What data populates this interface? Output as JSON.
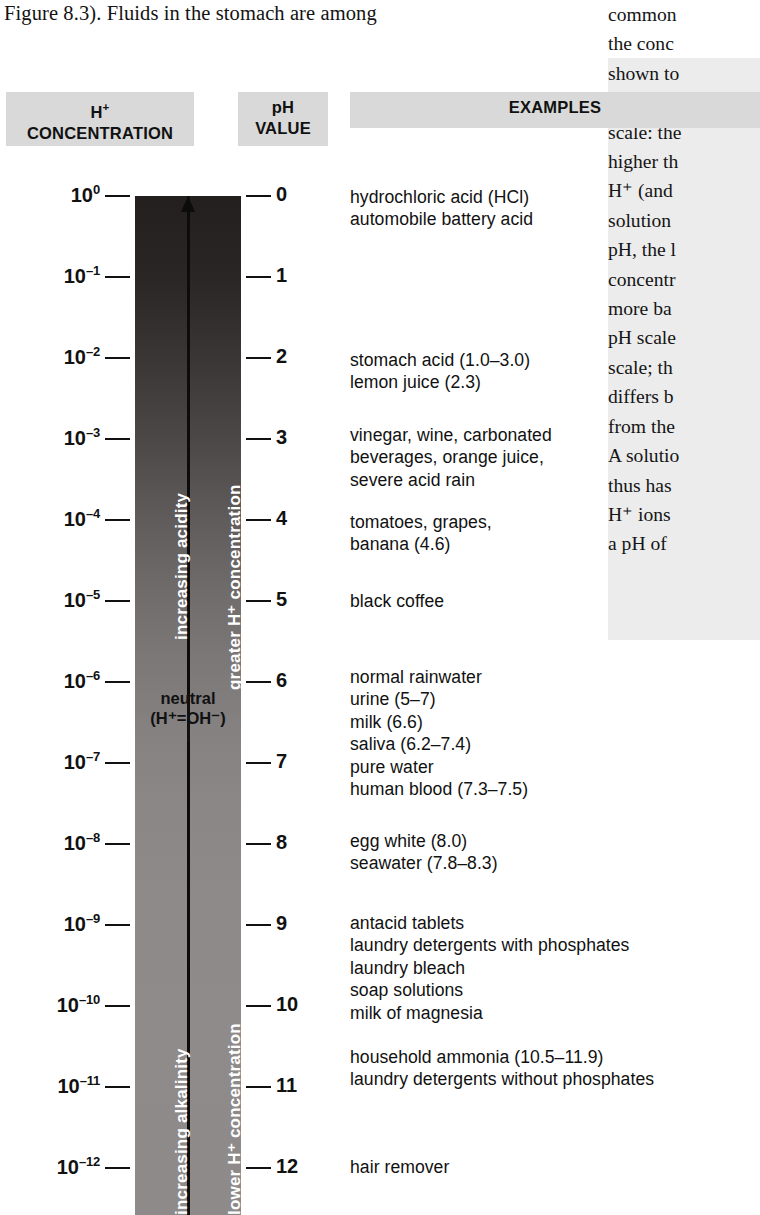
{
  "running_text": "Figure 8.3). Fluids in the stomach are among",
  "right_column_lines": [
    "common",
    "the conc",
    "shown to",
    "The pH s",
    "scale: the",
    "higher th",
    "H⁺ (and",
    "solution",
    "pH, the l",
    "concentr",
    "more ba",
    "pH scale",
    "scale; th",
    "differs b",
    "from the",
    "A solutio",
    "thus has",
    "H⁺ ions",
    "a pH of "
  ],
  "headers": {
    "concentration_line1": "H",
    "concentration_sup": "+",
    "concentration_line2": "CONCENTRATION",
    "ph_line1": "pH",
    "ph_line2": "VALUE",
    "examples": "EXAMPLES"
  },
  "bar_labels": {
    "acid_left": "increasing acidity",
    "acid_right": "greater H⁺ concentration",
    "base_left": "increasing alkalinity",
    "base_right": "lower H⁺ concentration",
    "neutral_line1": "neutral",
    "neutral_line2": "(H⁺=OH⁻)"
  },
  "chart_data": {
    "type": "table",
    "title": "pH scale",
    "columns": [
      "H+ CONCENTRATION",
      "pH VALUE",
      "EXAMPLES"
    ],
    "ph_values": [
      0,
      1,
      2,
      3,
      4,
      5,
      6,
      7,
      8,
      9,
      10,
      11,
      12,
      13
    ],
    "concentrations": [
      {
        "mantissa": "10",
        "exponent": "0"
      },
      {
        "mantissa": "10",
        "exponent": "–1"
      },
      {
        "mantissa": "10",
        "exponent": "–2"
      },
      {
        "mantissa": "10",
        "exponent": "–3"
      },
      {
        "mantissa": "10",
        "exponent": "–4"
      },
      {
        "mantissa": "10",
        "exponent": "–5"
      },
      {
        "mantissa": "10",
        "exponent": "–6"
      },
      {
        "mantissa": "10",
        "exponent": "–7"
      },
      {
        "mantissa": "10",
        "exponent": "–8"
      },
      {
        "mantissa": "10",
        "exponent": "–9"
      },
      {
        "mantissa": "10",
        "exponent": "–10"
      },
      {
        "mantissa": "10",
        "exponent": "–11"
      },
      {
        "mantissa": "10",
        "exponent": "–12"
      },
      {
        "mantissa": "10",
        "exponent": "–13"
      }
    ],
    "examples": [
      {
        "ph": 0,
        "text": "hydrochloric acid (HCl)\nautomobile battery acid"
      },
      {
        "ph": 2,
        "text": "stomach acid (1.0–3.0)\nlemon juice (2.3)"
      },
      {
        "ph": 3,
        "text": "vinegar, wine, carbonated\nbeverages, orange juice,\nsevere acid rain"
      },
      {
        "ph": 4,
        "text": "tomatoes, grapes,\nbanana (4.6)"
      },
      {
        "ph": 5,
        "text": "black coffee"
      },
      {
        "ph": 6,
        "text": "normal rainwater\nurine (5–7)\nmilk (6.6)\nsaliva (6.2–7.4)\npure water\nhuman blood (7.3–7.5)"
      },
      {
        "ph": 8,
        "text": "egg white (8.0)\nseawater (7.8–8.3)"
      },
      {
        "ph": 9,
        "text": "antacid tablets\nlaundry detergents with phosphates\nlaundry bleach\nsoap solutions\nmilk of magnesia"
      },
      {
        "ph": 11,
        "text": "household ammonia (10.5–11.9)\nlaundry detergents without phosphates"
      },
      {
        "ph": 13,
        "text": "hair remover"
      }
    ],
    "colors": {
      "acid_end": "#231f1f",
      "base_end": "#8f8b8b",
      "header_box": "#d9d9d9",
      "text": "#111111"
    }
  },
  "examples_blocks": [
    {
      "top": 186,
      "text_lines": [
        "hydrochloric acid (HCl)",
        "automobile battery acid"
      ]
    },
    {
      "top": 349,
      "text_lines": [
        "stomach acid (1.0–3.0)",
        "lemon juice (2.3)"
      ]
    },
    {
      "top": 424,
      "text_lines": [
        "vinegar, wine, carbonated",
        "beverages, orange juice,",
        "severe acid rain"
      ]
    },
    {
      "top": 511,
      "text_lines": [
        "tomatoes, grapes,",
        "banana (4.6)"
      ]
    },
    {
      "top": 590,
      "text_lines": [
        "black coffee"
      ]
    },
    {
      "top": 666,
      "text_lines": [
        "normal rainwater",
        "urine (5–7)",
        "milk (6.6)",
        "saliva (6.2–7.4)",
        "pure water",
        "human blood (7.3–7.5)"
      ]
    },
    {
      "top": 830,
      "text_lines": [
        "egg white (8.0)",
        "seawater (7.8–8.3)"
      ]
    },
    {
      "top": 912,
      "text_lines": [
        "antacid tablets",
        "laundry detergents with phosphates",
        "laundry bleach",
        "soap solutions",
        "milk of magnesia"
      ]
    },
    {
      "top": 1046,
      "text_lines": [
        "household ammonia (10.5–11.9)",
        "laundry detergents without phosphates"
      ]
    },
    {
      "top": 1156,
      "text_lines": [
        "hair remover"
      ]
    }
  ]
}
